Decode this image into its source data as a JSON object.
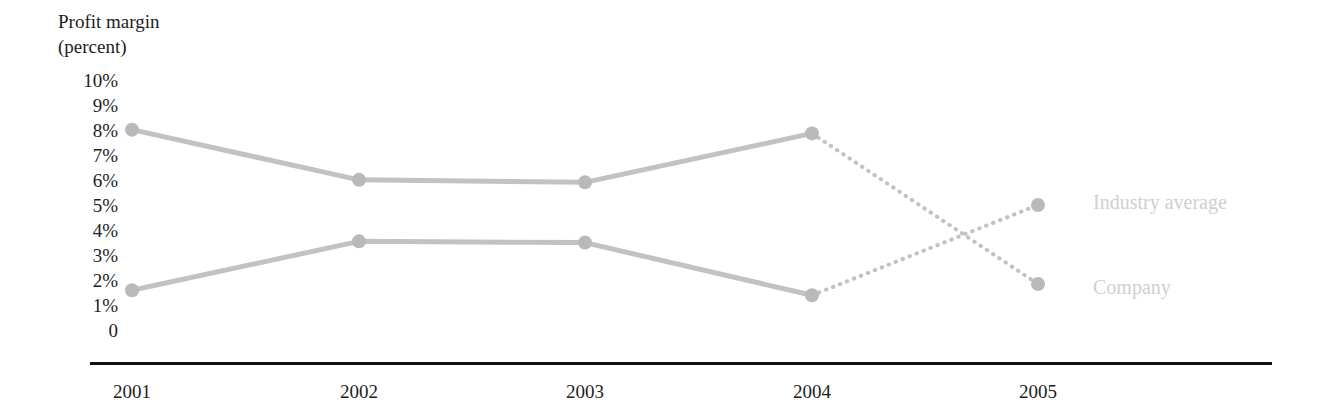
{
  "chart_data": {
    "type": "line",
    "title": "Profit margin (percent)",
    "title_lines": [
      "Profit margin",
      "(percent)"
    ],
    "xlabel": "",
    "ylabel": "Profit margin (percent)",
    "categories": [
      "2001",
      "2002",
      "2003",
      "2004",
      "2005"
    ],
    "x_tick_labels": [
      "2001",
      "2002",
      "2003",
      "2004",
      "2005"
    ],
    "y_tick_labels": [
      "10%",
      "9%",
      "8%",
      "7%",
      "6%",
      "5%",
      "4%",
      "3%",
      "2%",
      "1%",
      "0"
    ],
    "ylim": [
      0,
      10
    ],
    "grid": false,
    "legend_position": "right-inline",
    "projection_note": "2004 to 2005 segments drawn dotted (projected)",
    "series": [
      {
        "name": "Industry average",
        "label": "Industry average",
        "values": [
          8.5,
          6.5,
          6.4,
          8.35,
          2.35
        ],
        "solid_through": "2004",
        "dotted_from": "2004",
        "color": "#c0c0c0"
      },
      {
        "name": "Company",
        "label": "Company",
        "values": [
          2.1,
          4.05,
          4.0,
          1.9,
          5.5
        ],
        "solid_through": "2004",
        "dotted_from": "2004",
        "color": "#c8c8c8"
      }
    ]
  },
  "colors": {
    "line": "#c2c2c2",
    "marker": "#b9b9b9",
    "axis": "#111111",
    "tick_text": "#1d1d1d",
    "series_label": "#cfcfcf",
    "background": "#ffffff"
  }
}
